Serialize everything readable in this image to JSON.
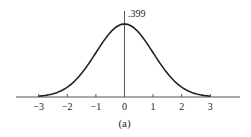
{
  "chart_data": {
    "type": "line",
    "title": "",
    "caption": "(a)",
    "xlabel": "",
    "ylabel": "",
    "x_ticks": [
      "-3",
      "-2",
      "-1",
      "0",
      "1",
      "2",
      "3"
    ],
    "y_annotation": ".399",
    "xlim": [
      -3.75,
      4.0
    ],
    "ylim": [
      0,
      0.399
    ],
    "series": [
      {
        "name": "standard normal density",
        "function": "exp(-x^2/2)/sqrt(2*pi)",
        "x": [
          -3,
          -2.5,
          -2,
          -1.5,
          -1,
          -0.5,
          0,
          0.5,
          1,
          1.5,
          2,
          2.5,
          3
        ],
        "y": [
          0.004,
          0.018,
          0.054,
          0.13,
          0.242,
          0.352,
          0.399,
          0.352,
          0.242,
          0.13,
          0.054,
          0.018,
          0.004
        ]
      }
    ],
    "grid": false,
    "legend": null
  },
  "colors": {
    "axis": "#555555",
    "curve": "#222222"
  }
}
